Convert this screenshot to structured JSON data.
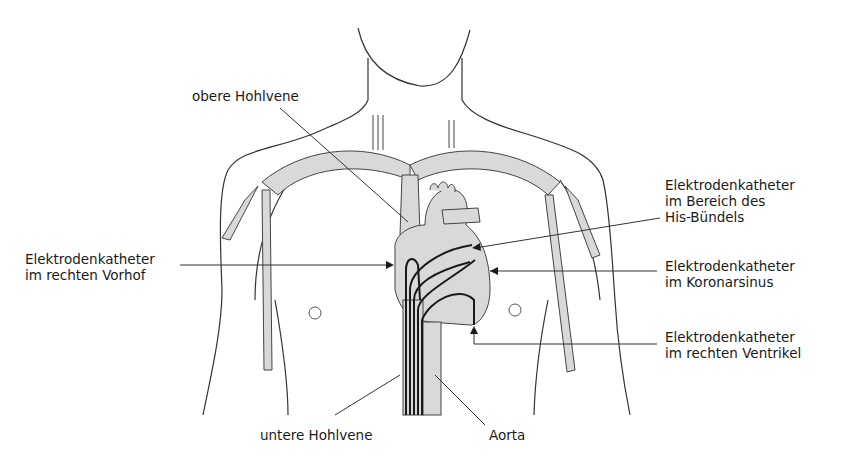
{
  "diagram": {
    "labels": {
      "obere_hohlvene": "obere Hohlvene",
      "vorhof": {
        "line1": "Elektrodenkatheter",
        "line2": "im rechten Vorhof"
      },
      "his": {
        "line1": "Elektrodenkatheter",
        "line2": "im Bereich des",
        "line3": "His-Bündels"
      },
      "koronarsinus": {
        "line1": "Elektrodenkatheter",
        "line2": "im Koronarsinus"
      },
      "ventrikel": {
        "line1": "Elektrodenkatheter",
        "line2": "im rechten Ventrikel"
      },
      "untere_hohlvene": "untere Hohlvene",
      "aorta": "Aorta"
    },
    "colors": {
      "outline": "#333333",
      "vessel_fill": "#d9d9d9",
      "catheter": "#1a1a1a",
      "background": "#ffffff"
    }
  }
}
